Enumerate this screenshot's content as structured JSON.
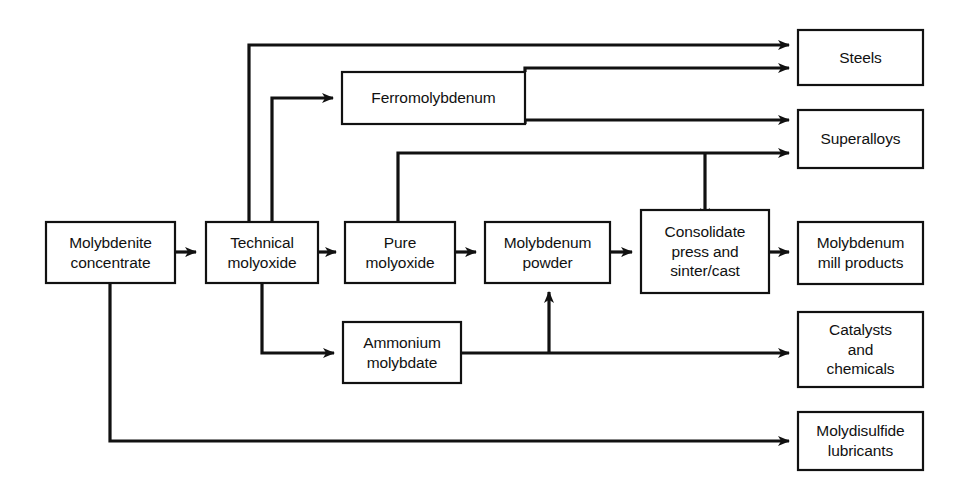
{
  "diagram": {
    "colors": {
      "line": "#111111",
      "box_fill": "#ffffff",
      "background": "#ffffff"
    },
    "nodes": [
      {
        "id": "molybdenite_concentrate",
        "label": "Molybdenite\nconcentrate",
        "x": 46,
        "y": 222,
        "w": 129,
        "h": 61
      },
      {
        "id": "technical_molyoxide",
        "label": "Technical\nmolyoxide",
        "x": 206,
        "y": 222,
        "w": 112,
        "h": 61
      },
      {
        "id": "ferromolybdenum",
        "label": "Ferromolybdenum",
        "x": 342,
        "y": 72,
        "w": 183,
        "h": 52
      },
      {
        "id": "pure_molyoxide",
        "label": "Pure\nmolyoxide",
        "x": 345,
        "y": 222,
        "w": 110,
        "h": 61
      },
      {
        "id": "molybdenum_powder",
        "label": "Molybdenum\npowder",
        "x": 485,
        "y": 222,
        "w": 125,
        "h": 61
      },
      {
        "id": "consolidate",
        "label": "Consolidate\npress and\nsinter/cast",
        "x": 641,
        "y": 210,
        "w": 128,
        "h": 83
      },
      {
        "id": "ammonium_molybdate",
        "label": "Ammonium\nmolybdate",
        "x": 343,
        "y": 322,
        "w": 118,
        "h": 61
      },
      {
        "id": "steels",
        "label": "Steels",
        "x": 798,
        "y": 30,
        "w": 125,
        "h": 55
      },
      {
        "id": "superalloys",
        "label": "Superalloys",
        "x": 798,
        "y": 110,
        "w": 125,
        "h": 58
      },
      {
        "id": "molybdenum_mill_products",
        "label": "Molybdenum\nmill products",
        "x": 798,
        "y": 222,
        "w": 125,
        "h": 62
      },
      {
        "id": "catalysts_and_chemicals",
        "label": "Catalysts\nand\nchemicals",
        "x": 798,
        "y": 312,
        "w": 125,
        "h": 75
      },
      {
        "id": "molydisulfide_lubricants",
        "label": "Molydisulfide\nlubricants",
        "x": 798,
        "y": 412,
        "w": 125,
        "h": 58
      }
    ],
    "edges": [
      {
        "id": "concentrate-to-technical",
        "from": "molybdenite_concentrate",
        "to": "technical_molyoxide",
        "points": "175,252 196,252",
        "arrow": true
      },
      {
        "id": "technical-to-pure",
        "from": "technical_molyoxide",
        "to": "pure_molyoxide",
        "points": "318,252 336,252",
        "arrow": true
      },
      {
        "id": "pure-to-powder",
        "from": "pure_molyoxide",
        "to": "molybdenum_powder",
        "points": "455,252 476,252",
        "arrow": true
      },
      {
        "id": "powder-to-consolidate",
        "from": "molybdenum_powder",
        "to": "consolidate",
        "points": "610,252 632,252",
        "arrow": true
      },
      {
        "id": "consolidate-to-mill-products",
        "from": "consolidate",
        "to": "molybdenum_mill_products",
        "points": "769,252 789,252",
        "arrow": true
      },
      {
        "id": "technical-to-steels",
        "from": "technical_molyoxide",
        "to": "steels",
        "points": "249,222 249,45 789,45",
        "arrow": true
      },
      {
        "id": "technical-to-ferromolybdenum",
        "from": "technical_molyoxide",
        "to": "ferromolybdenum",
        "points": "272,222 272,98 333,98",
        "arrow": true
      },
      {
        "id": "ferromolybdenum-to-steels",
        "from": "ferromolybdenum",
        "to": "steels",
        "points": "525,72 525,68 789,68",
        "arrow": true
      },
      {
        "id": "ferromolybdenum-to-superalloys",
        "from": "ferromolybdenum",
        "to": "superalloys",
        "points": "525,124 525,120 789,120",
        "arrow": true
      },
      {
        "id": "pure-to-superalloys",
        "from": "pure_molyoxide",
        "to": "superalloys",
        "points": "398,222 398,153 789,153",
        "arrow": true
      },
      {
        "id": "pure-branch-to-consolidate",
        "from": "pure_molyoxide",
        "to": "consolidate",
        "points": "705,153 705,219",
        "arrow": true
      },
      {
        "id": "technical-to-ammonium",
        "from": "technical_molyoxide",
        "to": "ammonium_molybdate",
        "points": "262,283 262,353 334,353",
        "arrow": true
      },
      {
        "id": "ammonium-to-catalysts",
        "from": "ammonium_molybdate",
        "to": "catalysts_and_chemicals",
        "points": "461,353 789,353",
        "arrow": true
      },
      {
        "id": "ammonium-branch-to-powder",
        "from": "ammonium_molybdate",
        "to": "molybdenum_powder",
        "points": "549,353 549,292",
        "arrow": true
      },
      {
        "id": "concentrate-to-lubricants",
        "from": "molybdenite_concentrate",
        "to": "molydisulfide_lubricants",
        "points": "110,283 110,441 789,441",
        "arrow": true
      }
    ]
  }
}
